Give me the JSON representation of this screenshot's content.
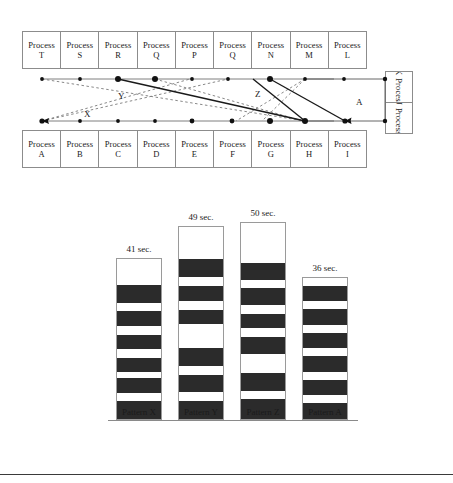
{
  "figure": {
    "diagram": {
      "top_row_label": "top-process-row",
      "top_processes": [
        {
          "word": "Process",
          "letter": "T"
        },
        {
          "word": "Process",
          "letter": "S"
        },
        {
          "word": "Process",
          "letter": "R"
        },
        {
          "word": "Process",
          "letter": "Q"
        },
        {
          "word": "Process",
          "letter": "P"
        },
        {
          "word": "Process",
          "letter": "Q"
        },
        {
          "word": "Process",
          "letter": "N"
        },
        {
          "word": "Process",
          "letter": "M"
        },
        {
          "word": "Process",
          "letter": "L"
        }
      ],
      "bottom_processes": [
        {
          "word": "Process",
          "letter": "A"
        },
        {
          "word": "Process",
          "letter": "B"
        },
        {
          "word": "Process",
          "letter": "C"
        },
        {
          "word": "Process",
          "letter": "D"
        },
        {
          "word": "Process",
          "letter": "E"
        },
        {
          "word": "Process",
          "letter": "F"
        },
        {
          "word": "Process",
          "letter": "G"
        },
        {
          "word": "Process",
          "letter": "H"
        },
        {
          "word": "Process",
          "letter": "I"
        }
      ],
      "side_processes": [
        {
          "word": "Process",
          "letter": "K"
        },
        {
          "word": "Process",
          "letter": "J"
        }
      ],
      "edge_labels": [
        {
          "text": "Y",
          "x": 118,
          "y": 91
        },
        {
          "text": "X",
          "x": 84,
          "y": 109
        },
        {
          "text": "Z",
          "x": 255,
          "y": 89
        },
        {
          "text": "A",
          "x": 356,
          "y": 97
        }
      ],
      "colors": {
        "box_border": "#8c8c8c",
        "solid_edge": "#1a1a1a",
        "dashed_edge": "#6f6f6f",
        "node_dot": "#111111"
      }
    },
    "chart_data": {
      "type": "bar",
      "title": "",
      "xlabel": "",
      "ylabel": "",
      "unit": "sec.",
      "categories": [
        "Pattern X",
        "Pattern Y",
        "Pattern Z",
        "Pattern A"
      ],
      "values": [
        41,
        49,
        50,
        36
      ],
      "value_labels": [
        "41 sec.",
        "49 sec.",
        "50 sec.",
        "36 sec."
      ],
      "ylim": [
        0,
        50
      ],
      "grid": false,
      "legend": "none",
      "bar_fill": "#ffffff",
      "segment_fill": "#2b2b2b",
      "bar_border": "#9a9a9a",
      "bars": [
        {
          "category": "Pattern X",
          "value": 41,
          "label": "41 sec.",
          "segments": [
            {
              "type": "light",
              "units": 9
            },
            {
              "type": "dark",
              "units": 6
            },
            {
              "type": "light",
              "units": 3
            },
            {
              "type": "dark",
              "units": 5
            },
            {
              "type": "light",
              "units": 3
            },
            {
              "type": "dark",
              "units": 5
            },
            {
              "type": "light",
              "units": 3
            },
            {
              "type": "dark",
              "units": 5
            },
            {
              "type": "light",
              "units": 2
            },
            {
              "type": "dark",
              "units": 5
            },
            {
              "type": "light",
              "units": 3
            },
            {
              "type": "dark",
              "units": 6
            }
          ]
        },
        {
          "category": "Pattern Y",
          "value": 49,
          "label": "49 sec.",
          "segments": [
            {
              "type": "light",
              "units": 11
            },
            {
              "type": "dark",
              "units": 6
            },
            {
              "type": "light",
              "units": 3
            },
            {
              "type": "dark",
              "units": 5
            },
            {
              "type": "light",
              "units": 3
            },
            {
              "type": "dark",
              "units": 5
            },
            {
              "type": "light",
              "units": 8
            },
            {
              "type": "dark",
              "units": 6
            },
            {
              "type": "light",
              "units": 3
            },
            {
              "type": "dark",
              "units": 6
            },
            {
              "type": "light",
              "units": 3
            },
            {
              "type": "dark",
              "units": 6
            }
          ]
        },
        {
          "category": "Pattern Z",
          "value": 50,
          "label": "50 sec.",
          "segments": [
            {
              "type": "light",
              "units": 14
            },
            {
              "type": "dark",
              "units": 6
            },
            {
              "type": "light",
              "units": 3
            },
            {
              "type": "dark",
              "units": 6
            },
            {
              "type": "light",
              "units": 3
            },
            {
              "type": "dark",
              "units": 5
            },
            {
              "type": "light",
              "units": 3
            },
            {
              "type": "dark",
              "units": 6
            },
            {
              "type": "light",
              "units": 7
            },
            {
              "type": "dark",
              "units": 6
            },
            {
              "type": "light",
              "units": 3
            },
            {
              "type": "dark",
              "units": 7
            }
          ]
        },
        {
          "category": "Pattern A",
          "value": 36,
          "label": "36 sec.",
          "segments": [
            {
              "type": "light",
              "units": 3
            },
            {
              "type": "dark",
              "units": 6
            },
            {
              "type": "light",
              "units": 3
            },
            {
              "type": "dark",
              "units": 6
            },
            {
              "type": "light",
              "units": 3
            },
            {
              "type": "dark",
              "units": 6
            },
            {
              "type": "light",
              "units": 3
            },
            {
              "type": "dark",
              "units": 6
            },
            {
              "type": "light",
              "units": 3
            },
            {
              "type": "dark",
              "units": 6
            },
            {
              "type": "light",
              "units": 3
            },
            {
              "type": "dark",
              "units": 6
            }
          ]
        }
      ]
    }
  }
}
